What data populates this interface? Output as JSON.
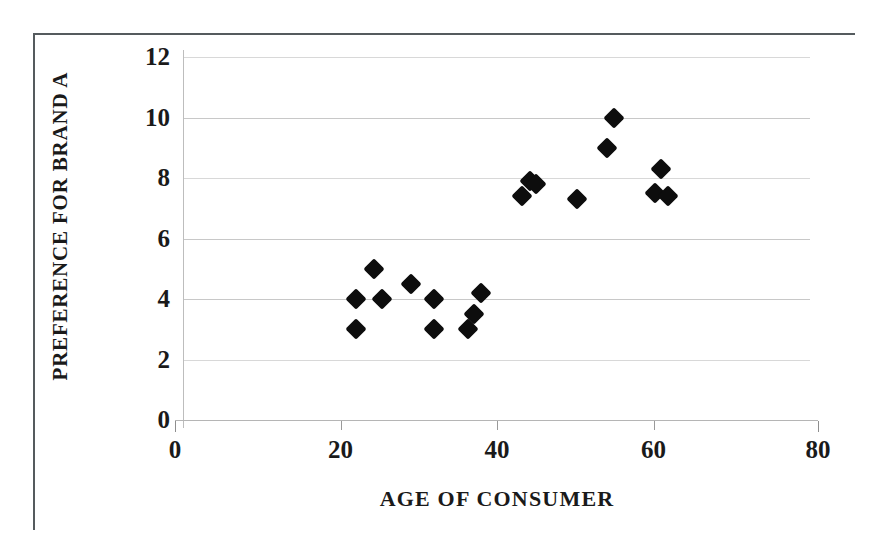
{
  "chart_data": {
    "type": "scatter",
    "title": "",
    "xlabel": "AGE OF CONSUMER",
    "ylabel": "PREFERENCE FOR BRAND A",
    "xlim": [
      0,
      80
    ],
    "ylim": [
      0,
      12
    ],
    "xticks": [
      "0",
      "20",
      "40",
      "60",
      "80"
    ],
    "xtick_values": [
      0,
      20,
      40,
      60,
      80
    ],
    "yticks": [
      "0",
      "2",
      "4",
      "6",
      "8",
      "10",
      "12"
    ],
    "ytick_values": [
      0,
      2,
      4,
      6,
      8,
      10,
      12
    ],
    "grid": true,
    "grid_axis": "y",
    "legend": false,
    "marker": "diamond",
    "marker_color": "#0d0d0d",
    "series": [
      {
        "name": "Consumers",
        "points": [
          {
            "x": 22.0,
            "y": 4.0
          },
          {
            "x": 22.0,
            "y": 3.0
          },
          {
            "x": 24.3,
            "y": 5.0
          },
          {
            "x": 25.3,
            "y": 4.0
          },
          {
            "x": 29.0,
            "y": 4.5
          },
          {
            "x": 32.0,
            "y": 4.0
          },
          {
            "x": 32.0,
            "y": 3.0
          },
          {
            "x": 36.3,
            "y": 3.0
          },
          {
            "x": 37.0,
            "y": 3.5
          },
          {
            "x": 38.0,
            "y": 4.2
          },
          {
            "x": 43.2,
            "y": 7.4
          },
          {
            "x": 44.2,
            "y": 7.9
          },
          {
            "x": 45.0,
            "y": 7.8
          },
          {
            "x": 50.2,
            "y": 7.3
          },
          {
            "x": 54.0,
            "y": 9.0
          },
          {
            "x": 55.0,
            "y": 10.0
          },
          {
            "x": 60.2,
            "y": 7.5
          },
          {
            "x": 61.0,
            "y": 8.3
          },
          {
            "x": 61.8,
            "y": 7.4
          }
        ]
      }
    ]
  },
  "axes": {
    "y_title": "PREFERENCE FOR BRAND A",
    "x_title": "AGE OF CONSUMER"
  }
}
